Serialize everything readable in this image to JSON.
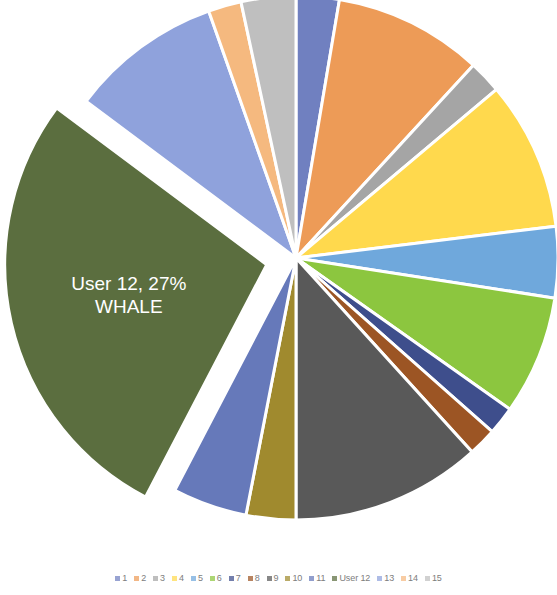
{
  "chart_data": {
    "type": "pie",
    "title": "",
    "subtitle": "",
    "xlabel": "",
    "ylabel": "",
    "legend_position": "bottom",
    "grid": false,
    "exploded_slice_index": 11,
    "explode_offset_px": 30,
    "categories": [
      "1",
      "2",
      "3",
      "4",
      "5",
      "6",
      "7",
      "8",
      "9",
      "10",
      "11",
      "User 12",
      "13",
      "14",
      "15"
    ],
    "values": [
      2.6,
      9.0,
      2.0,
      9.0,
      4.3,
      7.2,
      1.7,
      1.7,
      11.5,
      3.0,
      4.5,
      27.0,
      9.2,
      2.0,
      3.3
    ],
    "series": [
      {
        "name": "Users",
        "values": [
          2.6,
          9.0,
          2.0,
          9.0,
          4.3,
          7.2,
          1.7,
          1.7,
          11.5,
          3.0,
          4.5,
          27.0,
          9.2,
          2.0,
          3.3
        ]
      }
    ],
    "colors": [
      "#7080C0",
      "#ED9B57",
      "#A5A5A5",
      "#FFD94D",
      "#6FA8DC",
      "#8CC63F",
      "#3E4E8C",
      "#9C5524",
      "#595959",
      "#A08A2E",
      "#6679BA",
      "#5B6E3F",
      "#8FA2DC",
      "#F5B97F",
      "#BFBFBF"
    ],
    "annotations": [
      {
        "slice_index": 11,
        "line1": "User 12, 27%",
        "line2": "WHALE",
        "percent": 27
      }
    ]
  },
  "label": {
    "line1": "User 12, 27%",
    "line2": "WHALE"
  },
  "legend": {
    "items": [
      {
        "label": "1",
        "color": "#7080C0"
      },
      {
        "label": "2",
        "color": "#ED9B57"
      },
      {
        "label": "3",
        "color": "#A5A5A5"
      },
      {
        "label": "4",
        "color": "#FFD94D"
      },
      {
        "label": "5",
        "color": "#6FA8DC"
      },
      {
        "label": "6",
        "color": "#8CC63F"
      },
      {
        "label": "7",
        "color": "#3E4E8C"
      },
      {
        "label": "8",
        "color": "#9C5524"
      },
      {
        "label": "9",
        "color": "#595959"
      },
      {
        "label": "10",
        "color": "#A08A2E"
      },
      {
        "label": "11",
        "color": "#6679BA"
      },
      {
        "label": "User 12",
        "color": "#5B6E3F"
      },
      {
        "label": "13",
        "color": "#8FA2DC"
      },
      {
        "label": "14",
        "color": "#F5B97F"
      },
      {
        "label": "15",
        "color": "#BFBFBF"
      }
    ]
  }
}
